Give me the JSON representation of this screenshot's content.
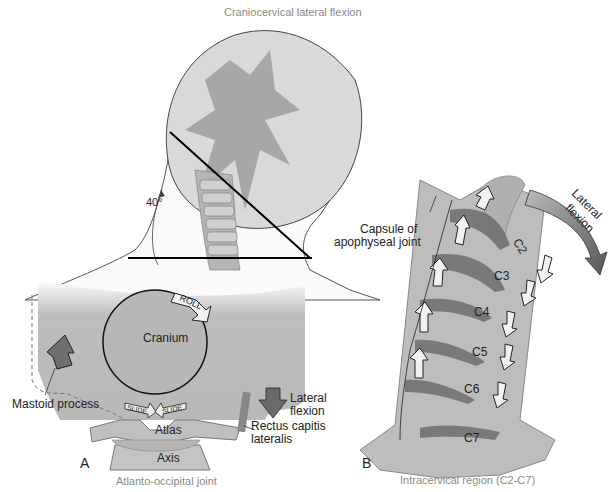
{
  "title": "Craniocervical lateral flexion",
  "top": {
    "angle_label": "40°"
  },
  "panel_a": {
    "letter": "A",
    "caption": "Atlanto-occipital joint",
    "labels": {
      "cranium": "Cranium",
      "roll": "ROLL",
      "slide_left": "SLIDE",
      "slide_right": "SLIDE",
      "atlas": "Atlas",
      "axis": "Axis",
      "mastoid": "Mastoid process",
      "lateral_flexion_1": "Lateral",
      "lateral_flexion_2": "flexion",
      "rectus_1": "Rectus capitis",
      "rectus_2": "lateralis"
    }
  },
  "panel_b": {
    "letter": "B",
    "caption": "Intracervical region (C2-C7)",
    "labels": {
      "capsule_1": "Capsule of",
      "capsule_2": "apophyseal joint",
      "lateral_flexion_1": "Lateral",
      "lateral_flexion_2": "flexion",
      "vertebrae": [
        "C2",
        "C3",
        "C4",
        "C5",
        "C6",
        "C7"
      ],
      "slide": "SLIDE"
    }
  },
  "colors": {
    "bone": "#b4b4b4",
    "bone_dark": "#6e6e6e",
    "skin": "#d6d6d6",
    "outline": "#333333",
    "arrow_light": "#efefef"
  }
}
